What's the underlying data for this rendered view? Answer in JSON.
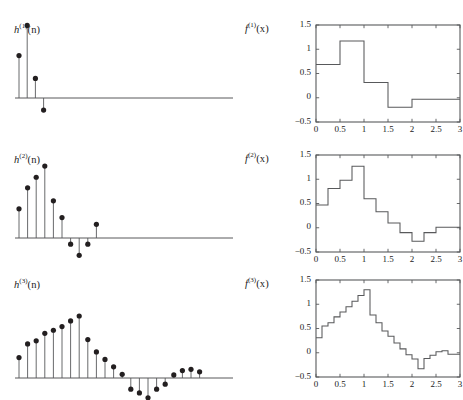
{
  "figure": {
    "caption_absent": true,
    "background_color": "#ffffff",
    "line_color": "#58595b",
    "marker_color": "#231f20",
    "axis_color": "#58595b"
  },
  "panels": {
    "left": [
      {
        "label_base": "h",
        "label_sup": "(1)",
        "label_arg": "(n)",
        "name": "h1"
      },
      {
        "label_base": "h",
        "label_sup": "(2)",
        "label_arg": "(n)",
        "name": "h2"
      },
      {
        "label_base": "h",
        "label_sup": "(3)",
        "label_arg": "(n)",
        "name": "h3"
      }
    ],
    "right": [
      {
        "label_base": "f",
        "label_sup": "(1)",
        "label_arg": "(x)",
        "name": "f1"
      },
      {
        "label_base": "f",
        "label_sup": "(2)",
        "label_arg": "(x)",
        "name": "f2"
      },
      {
        "label_base": "f",
        "label_sup": "(3)",
        "label_arg": "(x)",
        "name": "f3"
      }
    ]
  },
  "axes": {
    "ytick_labels": [
      "1.5",
      "1",
      "0.5",
      "0",
      "−0.5"
    ],
    "ytick_values": [
      1.5,
      1,
      0.5,
      0,
      -0.5
    ],
    "xtick_labels": [
      "0",
      "0.5",
      "1",
      "1.5",
      "2",
      "2.5",
      "3"
    ],
    "xtick_values": [
      0,
      0.5,
      1,
      1.5,
      2,
      2.5,
      3
    ],
    "ylim": [
      -0.5,
      1.5
    ],
    "xlim": [
      0,
      3
    ],
    "grid": false
  },
  "chart_data": [
    {
      "type": "scatter",
      "name": "h1-stem",
      "title": "h^(1)(n)",
      "xlabel": "n",
      "ylabel": "",
      "stem": true,
      "xlim": [
        0,
        48
      ],
      "ylim": [
        -0.35,
        1.25
      ],
      "x": [
        0,
        1,
        2,
        3
      ],
      "values": [
        0.685,
        1.17,
        0.315,
        -0.195
      ]
    },
    {
      "type": "scatter",
      "name": "h2-stem",
      "title": "h^(2)(n)",
      "xlabel": "n",
      "ylabel": "",
      "stem": true,
      "xlim": [
        0,
        48
      ],
      "ylim": [
        -0.35,
        1.25
      ],
      "x": [
        0,
        1,
        2,
        3,
        4,
        5,
        6,
        7,
        8,
        9,
        10,
        11
      ],
      "values": [
        0.47,
        0.81,
        0.98,
        1.16,
        0.6,
        0.33,
        -0.1,
        -0.28,
        -0.1,
        0.22,
        0.0,
        0.0
      ]
    },
    {
      "type": "scatter",
      "name": "h3-stem",
      "title": "h^(3)(n)",
      "xlabel": "n",
      "ylabel": "",
      "stem": true,
      "xlim": [
        0,
        48
      ],
      "ylim": [
        -0.35,
        1.25
      ],
      "x": [
        0,
        1,
        2,
        3,
        4,
        5,
        6,
        7,
        8,
        9,
        10,
        11,
        12,
        13,
        14,
        15,
        16,
        17,
        18,
        19,
        20,
        21,
        22,
        23
      ],
      "values": [
        0.33,
        0.55,
        0.6,
        0.72,
        0.77,
        0.83,
        0.92,
        1.0,
        0.62,
        0.42,
        0.3,
        0.18,
        0.06,
        -0.18,
        -0.24,
        -0.32,
        -0.18,
        -0.1,
        0.05,
        0.12,
        0.14,
        0.1,
        0.0,
        0.0
      ]
    },
    {
      "type": "area",
      "name": "f1-step",
      "title": "f^(1)(x)",
      "xlabel": "x",
      "ylabel": "",
      "step": true,
      "xlim": [
        0,
        3
      ],
      "ylim": [
        -0.5,
        1.5
      ],
      "x_edges": [
        0,
        0.5,
        1.0,
        1.5,
        2.0,
        3.0
      ],
      "values": [
        0.685,
        1.17,
        0.315,
        -0.195,
        -0.03
      ]
    },
    {
      "type": "area",
      "name": "f2-step",
      "title": "f^(2)(x)",
      "xlabel": "x",
      "ylabel": "",
      "step": true,
      "xlim": [
        0,
        3
      ],
      "ylim": [
        -0.5,
        1.5
      ],
      "x_edges": [
        0,
        0.25,
        0.5,
        0.75,
        1.0,
        1.25,
        1.5,
        1.75,
        2.0,
        2.25,
        2.5,
        3.0
      ],
      "values": [
        0.47,
        0.81,
        0.98,
        1.27,
        0.6,
        0.33,
        0.1,
        -0.1,
        -0.28,
        -0.1,
        0.01,
        -0.04
      ]
    },
    {
      "type": "area",
      "name": "f3-step",
      "title": "f^(3)(x)",
      "xlabel": "x",
      "ylabel": "",
      "step": true,
      "xlim": [
        0,
        3
      ],
      "ylim": [
        -0.5,
        1.5
      ],
      "x_edges": [
        0,
        0.125,
        0.25,
        0.375,
        0.5,
        0.625,
        0.75,
        0.875,
        1.0,
        1.125,
        1.25,
        1.375,
        1.5,
        1.625,
        1.75,
        1.875,
        2.0,
        2.125,
        2.25,
        2.375,
        2.5,
        2.625,
        2.75,
        3.0
      ],
      "values": [
        0.31,
        0.55,
        0.62,
        0.74,
        0.84,
        0.95,
        1.06,
        1.18,
        1.3,
        0.78,
        0.62,
        0.45,
        0.34,
        0.2,
        0.08,
        -0.04,
        -0.13,
        -0.33,
        -0.12,
        -0.05,
        0.02,
        0.04,
        -0.03,
        -0.03
      ]
    }
  ]
}
